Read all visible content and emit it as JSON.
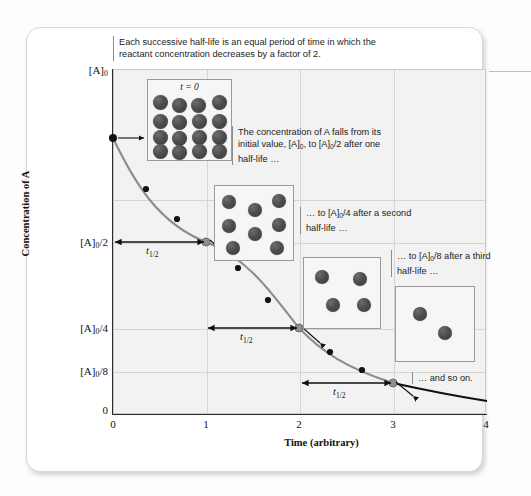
{
  "figure": {
    "top_caption": "Each successive half-life is an equal period of time in which the reactant concentration decreases by a factor of 2.",
    "callout_1": "The concentration of A falls from its initial value, [A]0, to [A]0/2 after one half-life …",
    "callout_2": "… to [A]0/4 after a second half-life …",
    "callout_3": "… to [A]0/8 after a third half-life …",
    "callout_4": "… and so on.",
    "half_life_label": "t1/2",
    "t_zero_label": "t = 0"
  },
  "chart_data": {
    "type": "line",
    "xlabel": "Time (arbitrary)",
    "ylabel": "Concentration of A",
    "xlim": [
      0,
      4
    ],
    "ylim": [
      0,
      1
    ],
    "grid": true,
    "legend": "none",
    "x_ticks": [
      "0",
      "1",
      "2",
      "3",
      "4"
    ],
    "x_tick_values": [
      0,
      1,
      2,
      3,
      4
    ],
    "y_ticks": [
      "0",
      "[A]0/8",
      "[A]0/4",
      "[A]0/2",
      "[A]0"
    ],
    "y_tick_values": [
      0,
      0.125,
      0.25,
      0.5,
      1.0
    ],
    "series": [
      {
        "name": "[A] vs time",
        "x": [
          0,
          0.35,
          0.7,
          1.0,
          1.35,
          1.7,
          2.0,
          2.35,
          2.7,
          3.0,
          3.4,
          3.7,
          4.0
        ],
        "values": [
          1.0,
          0.785,
          0.615,
          0.5,
          0.393,
          0.308,
          0.25,
          0.196,
          0.154,
          0.125,
          0.096,
          0.077,
          0.0625
        ]
      }
    ],
    "marked_points": [
      {
        "x": 0,
        "y": 1.0,
        "label": "[A]0"
      },
      {
        "x": 1,
        "y": 0.5,
        "label": "[A]0/2"
      },
      {
        "x": 2,
        "y": 0.25,
        "label": "[A]0/4"
      },
      {
        "x": 3,
        "y": 0.125,
        "label": "[A]0/8"
      }
    ],
    "half_life_spans": [
      {
        "from_x": 0,
        "to_x": 1,
        "y": 0.5,
        "label": "t1/2"
      },
      {
        "from_x": 1,
        "to_x": 2,
        "y": 0.25,
        "label": "t1/2"
      },
      {
        "from_x": 2,
        "to_x": 3,
        "y": 0.125,
        "label": "t1/2"
      }
    ],
    "molecule_boxes": [
      {
        "name": "box-t0",
        "count": 16,
        "caption": "t = 0"
      },
      {
        "name": "box-one-half-life",
        "count": 8,
        "caption": ""
      },
      {
        "name": "box-two-half-lives",
        "count": 4,
        "caption": ""
      },
      {
        "name": "box-three-half-lives",
        "count": 2,
        "caption": ""
      }
    ],
    "colors": {
      "curve": "#8c8c8c",
      "curve_tail": "#111111",
      "sphere": "#4d4d4d",
      "plot_background": "#f2f2f2",
      "grid": "#d5d5d5",
      "axis": "#2a2a2a"
    }
  }
}
